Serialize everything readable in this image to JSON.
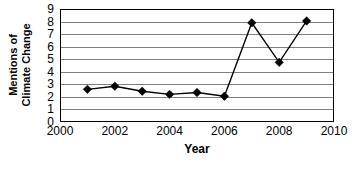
{
  "chart_data": {
    "type": "line",
    "title": "",
    "xlabel": "Year",
    "ylabel_line1": "Mentions of",
    "ylabel_line2": "Climate Change",
    "ylabel": "Mentions of Climate Change",
    "x": [
      2001,
      2002,
      2003,
      2004,
      2005,
      2006,
      2007,
      2008,
      2009
    ],
    "values": [
      2.6,
      2.85,
      2.45,
      2.2,
      2.35,
      2.05,
      7.9,
      4.75,
      8.05
    ],
    "series": [
      {
        "name": "Mentions of Climate Change",
        "values": [
          2.6,
          2.85,
          2.45,
          2.2,
          2.35,
          2.05,
          7.9,
          4.75,
          8.05
        ]
      }
    ],
    "xlim": [
      2000,
      2010
    ],
    "ylim": [
      0,
      9
    ],
    "x_tick_labels": [
      "2000",
      "2002",
      "2004",
      "2006",
      "2008",
      "2010"
    ],
    "x_tick_values": [
      2000,
      2002,
      2004,
      2006,
      2008,
      2010
    ],
    "y_tick_labels": [
      "0",
      "1",
      "2",
      "3",
      "4",
      "5",
      "6",
      "7",
      "8",
      "9"
    ],
    "y_tick_values": [
      0,
      1,
      2,
      3,
      4,
      5,
      6,
      7,
      8,
      9
    ],
    "grid": "horizontal",
    "legend": "none",
    "marker": "diamond",
    "line_color": "#000000",
    "marker_color": "#000000",
    "grid_color": "#808080",
    "axis_color": "#000000",
    "background_color": "#ffffff"
  }
}
